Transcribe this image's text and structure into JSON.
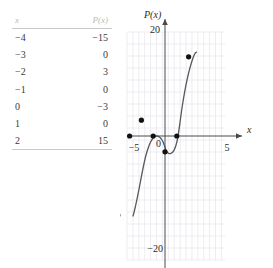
{
  "table": {
    "headers": {
      "x": "x",
      "px": "P(x)"
    },
    "rows": [
      {
        "x": "−4",
        "px": "−15"
      },
      {
        "x": "−3",
        "px": "0"
      },
      {
        "x": "−2",
        "px": "3"
      },
      {
        "x": "−1",
        "px": "0"
      },
      {
        "x": "0",
        "px": "−3"
      },
      {
        "x": "1",
        "px": "0"
      },
      {
        "x": "2",
        "px": "15"
      }
    ]
  },
  "graph": {
    "y_axis_label": "P(x)",
    "x_axis_label": "x",
    "origin_label": "0",
    "ticks": {
      "y_top": "20",
      "y_bottom": "−20",
      "x_left": "−5",
      "x_right": "5"
    },
    "colors": {
      "grid": "#e8e8ee",
      "axis": "#4a4a4a",
      "curve": "#58585c",
      "point": "#111111",
      "text": "#2b2b2b",
      "header_text": "#b9b9b9",
      "rule": "#c9c9c9",
      "background": "#ffffff"
    }
  },
  "chart_data": {
    "type": "line",
    "title": "",
    "xlabel": "x",
    "ylabel": "P(x)",
    "xlim": [
      -5,
      5
    ],
    "ylim": [
      -20,
      20
    ],
    "xticks": [
      -5,
      0,
      5
    ],
    "yticks": [
      -20,
      0,
      20
    ],
    "grid": true,
    "legend": "none",
    "series": [
      {
        "name": "P(x)",
        "x": [
          -4,
          -3,
          -2,
          -1,
          0,
          1,
          2
        ],
        "values": [
          -15,
          0,
          3,
          0,
          -3,
          0,
          15
        ],
        "marker": "filled-circle",
        "line": "smooth-curve"
      }
    ],
    "annotations": []
  }
}
